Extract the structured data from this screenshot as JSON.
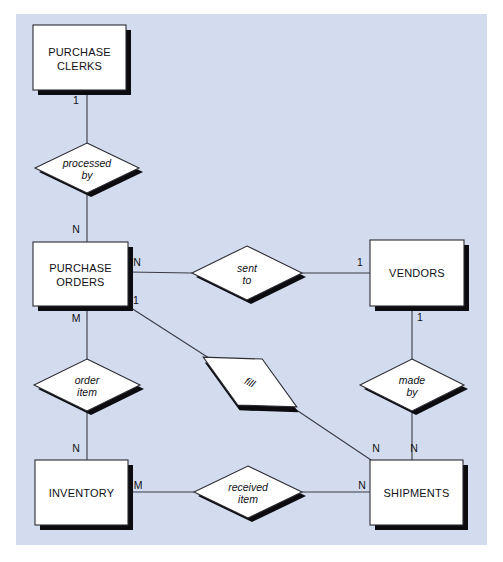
{
  "diagram": {
    "type": "entity-relationship-diagram",
    "background_color": "#d3dcee",
    "entity_fill": "#ffffff",
    "stroke_color": "#2b2b33",
    "shadow_color": "#0b0b10",
    "entities": [
      {
        "id": "purchase-clerks",
        "label_line1": "PURCHASE",
        "label_line2": "CLERKS",
        "x": 33,
        "y": 25,
        "w": 93,
        "h": 65
      },
      {
        "id": "purchase-orders",
        "label_line1": "PURCHASE",
        "label_line2": "ORDERS",
        "x": 33,
        "y": 242,
        "w": 95,
        "h": 64
      },
      {
        "id": "vendors",
        "label_line1": "VENDORS",
        "label_line2": "",
        "x": 370,
        "y": 240,
        "w": 94,
        "h": 66
      },
      {
        "id": "inventory",
        "label_line1": "INVENTORY",
        "label_line2": "",
        "x": 35,
        "y": 460,
        "w": 93,
        "h": 65
      },
      {
        "id": "shipments",
        "label_line1": "SHIPMENTS",
        "label_line2": "",
        "x": 370,
        "y": 460,
        "w": 93,
        "h": 65
      }
    ],
    "relationships": [
      {
        "id": "processed-by",
        "label_line1": "processed",
        "label_line2": "by",
        "cx": 87,
        "cy": 168,
        "rx": 52,
        "ry": 25,
        "rotated": false
      },
      {
        "id": "sent-to",
        "label_line1": "sent",
        "label_line2": "to",
        "cx": 247,
        "cy": 273,
        "rx": 55,
        "ry": 27,
        "rotated": false
      },
      {
        "id": "order-item",
        "label_line1": "order",
        "label_line2": "item",
        "cx": 87,
        "cy": 385,
        "rx": 53,
        "ry": 26,
        "rotated": false
      },
      {
        "id": "fill",
        "label_line1": "fill",
        "label_line2": "",
        "cx": 250,
        "cy": 382,
        "rx": 53,
        "ry": 26,
        "rotated": true,
        "rotation_deg": 28
      },
      {
        "id": "made-by",
        "label_line1": "made",
        "label_line2": "by",
        "cx": 412,
        "cy": 385,
        "rx": 52,
        "ry": 26,
        "rotated": false
      },
      {
        "id": "received-item",
        "label_line1": "received",
        "label_line2": "item",
        "cx": 248,
        "cy": 492,
        "rx": 54,
        "ry": 26,
        "rotated": false
      }
    ],
    "cardinalities": [
      {
        "id": "clerks-to-processedby",
        "text": "1",
        "x": 76,
        "y": 104
      },
      {
        "id": "processedby-to-orders",
        "text": "N",
        "x": 76,
        "y": 233
      },
      {
        "id": "orders-to-sentto",
        "text": "N",
        "x": 137,
        "y": 266
      },
      {
        "id": "sentto-to-vendors",
        "text": "1",
        "x": 360,
        "y": 266
      },
      {
        "id": "vendors-to-madeby",
        "text": "1",
        "x": 420,
        "y": 321
      },
      {
        "id": "orders-to-fill",
        "text": "1",
        "x": 136,
        "y": 304
      },
      {
        "id": "orders-to-orderitem",
        "text": "M",
        "x": 76,
        "y": 322
      },
      {
        "id": "orderitem-to-inventory",
        "text": "N",
        "x": 76,
        "y": 452
      },
      {
        "id": "inventory-to-receiveditem",
        "text": "M",
        "x": 138,
        "y": 489
      },
      {
        "id": "receiveditem-to-shipments",
        "text": "N",
        "x": 362,
        "y": 489
      },
      {
        "id": "fill-to-shipments",
        "text": "N",
        "x": 376,
        "y": 452
      },
      {
        "id": "madeby-to-shipments",
        "text": "N",
        "x": 414,
        "y": 452
      }
    ],
    "connectors": [
      {
        "id": "clerks-processedby",
        "x1": 87,
        "y1": 90,
        "x2": 87,
        "y2": 143
      },
      {
        "id": "processedby-orders",
        "x1": 87,
        "y1": 193,
        "x2": 87,
        "y2": 242
      },
      {
        "id": "orders-sentto",
        "x1": 128,
        "y1": 272,
        "x2": 192,
        "y2": 273
      },
      {
        "id": "sentto-vendors",
        "x1": 302,
        "y1": 273,
        "x2": 370,
        "y2": 273
      },
      {
        "id": "vendors-madeby",
        "x1": 412,
        "y1": 306,
        "x2": 412,
        "y2": 359
      },
      {
        "id": "madeby-shipments",
        "x1": 412,
        "y1": 411,
        "x2": 412,
        "y2": 460
      },
      {
        "id": "orders-orderitem",
        "x1": 87,
        "y1": 306,
        "x2": 87,
        "y2": 359
      },
      {
        "id": "orderitem-inventory",
        "x1": 87,
        "y1": 411,
        "x2": 87,
        "y2": 460
      },
      {
        "id": "inventory-receiveditem",
        "x1": 128,
        "y1": 492,
        "x2": 194,
        "y2": 492
      },
      {
        "id": "receiveditem-shipments",
        "x1": 302,
        "y1": 492,
        "x2": 370,
        "y2": 492
      },
      {
        "id": "orders-fill",
        "x1": 128,
        "y1": 306,
        "x2": 212,
        "y2": 360
      },
      {
        "id": "fill-shipments",
        "x1": 289,
        "y1": 405,
        "x2": 371,
        "y2": 460
      }
    ]
  }
}
